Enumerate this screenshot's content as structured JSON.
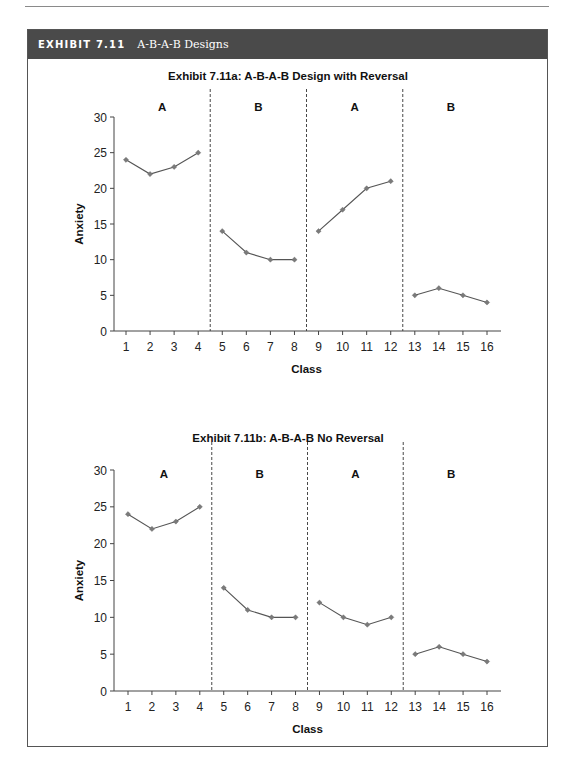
{
  "header": {
    "exhibit_number": "EXHIBIT 7.11",
    "exhibit_title": "A-B-A-B Designs"
  },
  "colors": {
    "header_bg": "#4a4a4a",
    "line": "#555555",
    "marker": "#7a7a7a",
    "axis": "#444444"
  },
  "chart_data": [
    {
      "type": "line",
      "title": "Exhibit 7.11a:  A-B-A-B Design with Reversal",
      "xlabel": "Class",
      "ylabel": "Anxiety",
      "ylim": [
        0,
        30
      ],
      "yticks": [
        0,
        5,
        10,
        15,
        20,
        25,
        30
      ],
      "x": [
        1,
        2,
        3,
        4,
        5,
        6,
        7,
        8,
        9,
        10,
        11,
        12,
        13,
        14,
        15,
        16
      ],
      "phases": [
        {
          "label": "A",
          "x": [
            1,
            2,
            3,
            4
          ],
          "values": [
            24,
            22,
            23,
            25
          ]
        },
        {
          "label": "B",
          "x": [
            5,
            6,
            7,
            8
          ],
          "values": [
            14,
            11,
            10,
            10
          ]
        },
        {
          "label": "A",
          "x": [
            9,
            10,
            11,
            12
          ],
          "values": [
            14,
            17,
            20,
            21
          ]
        },
        {
          "label": "B",
          "x": [
            13,
            14,
            15,
            16
          ],
          "values": [
            5,
            6,
            5,
            4
          ]
        }
      ],
      "phase_dividers": [
        4.5,
        8.5,
        12.5
      ],
      "grid": false,
      "legend": "none"
    },
    {
      "type": "line",
      "title": "Exhibit 7.11b:  A-B-A-B No Reversal",
      "xlabel": "Class",
      "ylabel": "Anxiety",
      "ylim": [
        0,
        30
      ],
      "yticks": [
        0,
        5,
        10,
        15,
        20,
        25,
        30
      ],
      "x": [
        1,
        2,
        3,
        4,
        5,
        6,
        7,
        8,
        9,
        10,
        11,
        12,
        13,
        14,
        15,
        16
      ],
      "phases": [
        {
          "label": "A",
          "x": [
            1,
            2,
            3,
            4
          ],
          "values": [
            24,
            22,
            23,
            25
          ]
        },
        {
          "label": "B",
          "x": [
            5,
            6,
            7,
            8
          ],
          "values": [
            14,
            11,
            10,
            10
          ]
        },
        {
          "label": "A",
          "x": [
            9,
            10,
            11,
            12
          ],
          "values": [
            12,
            10,
            9,
            10
          ]
        },
        {
          "label": "B",
          "x": [
            13,
            14,
            15,
            16
          ],
          "values": [
            5,
            6,
            5,
            4
          ]
        }
      ],
      "phase_dividers": [
        4.5,
        8.5,
        12.5
      ],
      "grid": false,
      "legend": "none"
    }
  ]
}
